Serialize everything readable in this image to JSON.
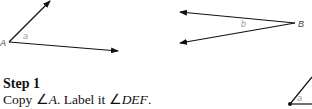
{
  "figures": {
    "angle_a": {
      "vertex_label": "A",
      "angle_label": "a"
    },
    "angle_b": {
      "vertex_label": "B",
      "angle_label": "b"
    },
    "partial_copy": {
      "angle_label": "a"
    }
  },
  "step": {
    "title": "Step 1",
    "text_copy": "Copy ",
    "angle_symbol_1": "∠",
    "angle_name_1": "A",
    "text_label": ". Label it ",
    "angle_symbol_2": "∠",
    "angle_name_2": "DEF",
    "text_end": "."
  }
}
